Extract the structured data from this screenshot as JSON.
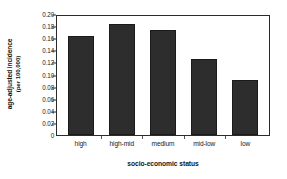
{
  "chart_data": {
    "type": "bar",
    "title": "",
    "categories": [
      "high",
      "high-mid",
      "medium",
      "mid-low",
      "low"
    ],
    "values": [
      0.166,
      0.186,
      0.177,
      0.128,
      0.093
    ],
    "xlabel": "socio-economic status",
    "ylabel": "age-adjusted incidence",
    "ylabel_line2": "(per 100,000)",
    "ylim": [
      0,
      0.2
    ],
    "ytick_labels": [
      "0",
      "0.02",
      "0.04",
      "0.06",
      "0.08",
      "0.10",
      "0.12",
      "0.14",
      "0.16",
      "0.18",
      "0.20"
    ],
    "ytick_values": [
      0,
      0.02,
      0.04,
      0.06,
      0.08,
      0.1,
      0.12,
      0.14,
      0.16,
      0.18,
      0.2
    ],
    "grid": false,
    "legend": null,
    "bar_color": "#2d2d2d",
    "axis_color": "#2b2b2b",
    "background": "#ffffff"
  }
}
